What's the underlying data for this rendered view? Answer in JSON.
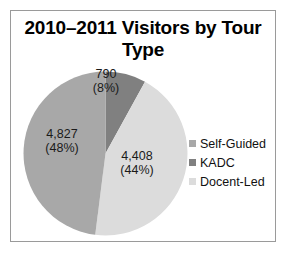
{
  "chart_data": {
    "type": "pie",
    "title": "2010–2011 Visitors by Tour Type",
    "categories": [
      "Self-Guided",
      "KADC",
      "Docent-Led"
    ],
    "values": [
      4827,
      790,
      4408
    ],
    "percentages": [
      48,
      44,
      8
    ],
    "slices": [
      {
        "name": "KADC",
        "value": 790,
        "value_label": "790",
        "percent": 8,
        "percent_label": "(8%)",
        "color": "#808080",
        "start_deg": 0,
        "sweep_deg": 28.8
      },
      {
        "name": "Docent-Led",
        "value": 4408,
        "value_label": "4,408",
        "percent": 44,
        "percent_label": "(44%)",
        "color": "#dcdcdc",
        "start_deg": 28.8,
        "sweep_deg": 158.4
      },
      {
        "name": "Self-Guided",
        "value": 4827,
        "value_label": "4,827",
        "percent": 48,
        "percent_label": "(48%)",
        "color": "#a8a8a8",
        "start_deg": 187.2,
        "sweep_deg": 172.8
      }
    ],
    "legend": {
      "position": "right",
      "entries": [
        {
          "label": "Self-Guided",
          "color": "#a8a8a8"
        },
        {
          "label": "KADC",
          "color": "#808080"
        },
        {
          "label": "Docent-Led",
          "color": "#dcdcdc"
        }
      ]
    },
    "grid": false,
    "xlabel": "",
    "ylabel": ""
  }
}
